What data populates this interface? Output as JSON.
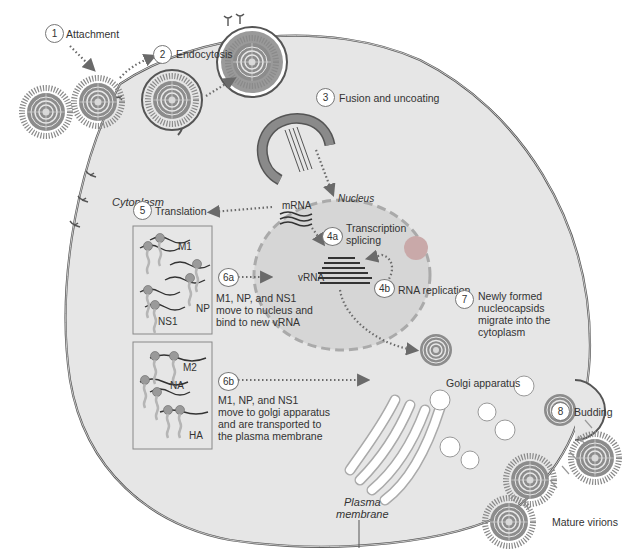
{
  "diagram": {
    "regions": {
      "cytoplasm": "Cytoplasm",
      "nucleus": "Nucleus",
      "plasma_membrane_line1": "Plasma",
      "plasma_membrane_line2": "membrane",
      "golgi": "Golgi apparatus",
      "mature_virions": "Mature virions"
    },
    "steps": [
      {
        "id": "1",
        "label": "Attachment"
      },
      {
        "id": "2",
        "label": "Endocytosis"
      },
      {
        "id": "3",
        "label": "Fusion and uncoating"
      },
      {
        "id": "4a",
        "label_line1": "Transcription",
        "label_line2": "splicing"
      },
      {
        "id": "4b",
        "label": "RNA replication"
      },
      {
        "id": "5",
        "label": "Translation"
      },
      {
        "id": "6a",
        "label_line1": "M1, NP, and NS1",
        "label_line2": "move to nucleus and",
        "label_line3": "bind to new vRNA"
      },
      {
        "id": "6b",
        "label_line1": "M1, NP, and NS1",
        "label_line2": "move to golgi apparatus",
        "label_line3": "and are transported to",
        "label_line4": "the plasma membrane"
      },
      {
        "id": "7",
        "label_line1": "Newly formed",
        "label_line2": "nucleocapsids",
        "label_line3": "migrate into the",
        "label_line4": "cytoplasm"
      },
      {
        "id": "8",
        "label": "Budding"
      }
    ],
    "molecules": {
      "mrna": "mRNA",
      "vrna": "vRNA"
    },
    "protein_box_1": [
      "M1",
      "NP",
      "NS1"
    ],
    "protein_box_2": [
      "M2",
      "NA",
      "HA"
    ],
    "colors": {
      "cell_fill": "#e6e6e6",
      "nucleus_fill": "#d6d6d6",
      "membrane": "#555555",
      "arrow": "#6a6a6a",
      "virion": "#8a8a8a",
      "nucleolus": "#c9a9a9"
    }
  }
}
